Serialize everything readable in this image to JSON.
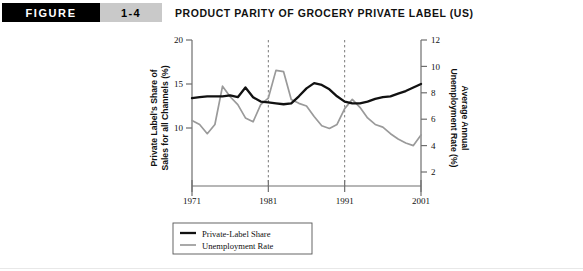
{
  "header": {
    "figure_label": "FIGURE",
    "figure_number": "1-4",
    "title": "PRODUCT PARITY OF GROCERY PRIVATE LABEL (US)"
  },
  "colors": {
    "figure_box_bg": "#000000",
    "figure_box_text": "#ffffff",
    "number_box_bg": "#c9c9c9",
    "private_label_series": "#111111",
    "unemployment_series": "#9a9a9a",
    "axis": "#6e6e6e"
  },
  "chart_data": {
    "type": "line",
    "title": "PRODUCT PARITY OF GROCERY PRIVATE LABEL (US)",
    "xlabel": "",
    "ylabel": "Private Label's Share of Sales for all Channels (%)",
    "y2label": "Average Annual Unemployment Rate (%)",
    "xlim": [
      1971,
      2001
    ],
    "ylim": [
      0,
      20
    ],
    "y2lim": [
      0,
      12
    ],
    "xticks": [
      1971,
      1981,
      1991,
      2001
    ],
    "yticks": [
      10,
      15,
      20
    ],
    "y2ticks": [
      2,
      4,
      6,
      8,
      10,
      12
    ],
    "xticklabels": [
      "1971",
      "1981",
      "1991",
      "2001"
    ],
    "yticklabels": [
      "10",
      "15",
      "20"
    ],
    "y2ticklabels": [
      "2",
      "4",
      "6",
      "8",
      "10",
      "12"
    ],
    "grid": false,
    "reference_lines": [
      1981,
      1991
    ],
    "legend_position": "bottom-left",
    "x": [
      1971,
      1972,
      1973,
      1974,
      1975,
      1976,
      1977,
      1978,
      1979,
      1980,
      1981,
      1982,
      1983,
      1984,
      1985,
      1986,
      1987,
      1988,
      1989,
      1990,
      1991,
      1992,
      1993,
      1994,
      1995,
      1996,
      1997,
      1998,
      1999,
      2000,
      2001
    ],
    "series": [
      {
        "name": "Private-Label Share",
        "axis": "left",
        "color": "#111111",
        "units": "%",
        "values": [
          13.4,
          13.5,
          13.6,
          13.6,
          13.6,
          13.7,
          13.5,
          14.6,
          13.5,
          13.0,
          12.9,
          12.8,
          12.7,
          12.8,
          13.6,
          14.5,
          15.1,
          14.9,
          14.4,
          13.6,
          13.0,
          12.8,
          12.8,
          13.0,
          13.3,
          13.5,
          13.6,
          13.9,
          14.2,
          14.6,
          15.0
        ]
      },
      {
        "name": "Unemployment Rate",
        "axis": "right",
        "color": "#9a9a9a",
        "units": "%",
        "values": [
          5.9,
          5.6,
          4.9,
          5.6,
          8.5,
          7.7,
          7.1,
          6.1,
          5.8,
          7.1,
          7.6,
          9.7,
          9.6,
          7.5,
          7.2,
          7.0,
          6.2,
          5.5,
          5.3,
          5.6,
          6.8,
          7.5,
          6.9,
          6.1,
          5.6,
          5.4,
          4.9,
          4.5,
          4.2,
          4.0,
          4.8
        ]
      }
    ]
  },
  "legend": {
    "items": [
      {
        "label": "Private-Label Share"
      },
      {
        "label": "Unemployment Rate"
      }
    ]
  }
}
